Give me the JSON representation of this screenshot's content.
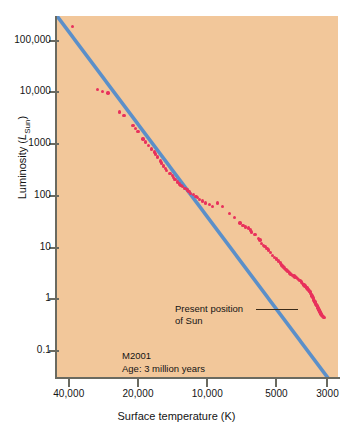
{
  "chart_data": {
    "type": "scatter",
    "title": "",
    "xlabel": "Surface temperature (K)",
    "ylabel": "Luminosity (L_Sun)",
    "ylabel_parts": {
      "text": "Luminosity (",
      "italic": "L",
      "sub": "Sun",
      "close": ")"
    },
    "x_scale": "log-reversed",
    "y_scale": "log",
    "xlim": [
      45000,
      2700
    ],
    "ylim": [
      0.03,
      300000
    ],
    "xticks": [
      40000,
      20000,
      10000,
      5000,
      3000
    ],
    "xtick_labels": [
      "40,000",
      "20,000",
      "10,000",
      "5000",
      "3000"
    ],
    "yticks": [
      100000,
      10000,
      1000,
      100,
      10,
      1,
      0.1
    ],
    "ytick_labels": [
      "100,000",
      "10,000",
      "1000",
      "100",
      "10",
      "1",
      "0.1"
    ],
    "grid": false,
    "legend": "none",
    "background_color": "#f2c79a",
    "point_color": "#e8315c",
    "line_color": "#5b8fc9",
    "annotations": [
      {
        "name": "present-position-of-sun",
        "line1": "Present position",
        "line2": "of Sun"
      },
      {
        "name": "cluster-id",
        "line1": "M2001",
        "line2": "Age: 3 million years"
      }
    ],
    "series": [
      {
        "name": "main-sequence-fit",
        "type": "line",
        "color": "#5b8fc9",
        "points": [
          [
            45000,
            300000
          ],
          [
            2950,
            0.028
          ]
        ]
      },
      {
        "name": "cluster-stars",
        "type": "scatter",
        "color": "#e8315c",
        "points": [
          [
            38500,
            190000
          ],
          [
            30000,
            11500
          ],
          [
            28500,
            10500
          ],
          [
            27000,
            9800
          ],
          [
            24000,
            4200
          ],
          [
            23000,
            3600
          ],
          [
            21000,
            2300
          ],
          [
            20500,
            2000
          ],
          [
            20000,
            1750
          ],
          [
            19000,
            1250
          ],
          [
            18500,
            1100
          ],
          [
            18000,
            950
          ],
          [
            17500,
            800
          ],
          [
            17000,
            700
          ],
          [
            16800,
            640
          ],
          [
            16500,
            560
          ],
          [
            16000,
            470
          ],
          [
            15800,
            430
          ],
          [
            15500,
            380
          ],
          [
            15200,
            340
          ],
          [
            15000,
            310
          ],
          [
            14500,
            270
          ],
          [
            14200,
            245
          ],
          [
            14000,
            225
          ],
          [
            13800,
            205
          ],
          [
            13500,
            185
          ],
          [
            13200,
            170
          ],
          [
            13000,
            160
          ],
          [
            12800,
            150
          ],
          [
            12500,
            140
          ],
          [
            12200,
            130
          ],
          [
            12000,
            120
          ],
          [
            11800,
            112
          ],
          [
            11500,
            105
          ],
          [
            11200,
            98
          ],
          [
            11000,
            92
          ],
          [
            10800,
            86
          ],
          [
            10500,
            80
          ],
          [
            10200,
            72
          ],
          [
            9800,
            68
          ],
          [
            9500,
            62
          ],
          [
            9000,
            72
          ],
          [
            8600,
            62
          ],
          [
            8000,
            45
          ],
          [
            7600,
            38
          ],
          [
            7200,
            30
          ],
          [
            7000,
            27
          ],
          [
            6800,
            25
          ],
          [
            6600,
            24
          ],
          [
            6500,
            22
          ],
          [
            6400,
            20
          ],
          [
            6200,
            18
          ],
          [
            6000,
            15
          ],
          [
            5900,
            14
          ],
          [
            5800,
            12
          ],
          [
            5700,
            11
          ],
          [
            5600,
            10.5
          ],
          [
            5500,
            9.5
          ],
          [
            5400,
            9
          ],
          [
            5300,
            8
          ],
          [
            5200,
            7
          ],
          [
            5100,
            6.5
          ],
          [
            5000,
            6
          ],
          [
            4900,
            5.5
          ],
          [
            4800,
            5
          ],
          [
            4750,
            4.6
          ],
          [
            4700,
            4.4
          ],
          [
            4650,
            4.2
          ],
          [
            4600,
            4
          ],
          [
            4550,
            3.8
          ],
          [
            4500,
            3.6
          ],
          [
            4450,
            3.4
          ],
          [
            4400,
            3.2
          ],
          [
            4350,
            3.1
          ],
          [
            4300,
            3
          ],
          [
            4250,
            2.9
          ],
          [
            4200,
            2.8
          ],
          [
            4150,
            2.7
          ],
          [
            4100,
            2.6
          ],
          [
            4050,
            2.5
          ],
          [
            4000,
            2.4
          ],
          [
            3950,
            2.3
          ],
          [
            3900,
            2.2
          ],
          [
            3880,
            2.1
          ],
          [
            3850,
            2.0
          ],
          [
            3820,
            1.95
          ],
          [
            3800,
            1.9
          ],
          [
            3780,
            1.85
          ],
          [
            3750,
            1.8
          ],
          [
            3730,
            1.75
          ],
          [
            3700,
            1.7
          ],
          [
            3680,
            1.65
          ],
          [
            3660,
            1.6
          ],
          [
            3640,
            1.55
          ],
          [
            3620,
            1.5
          ],
          [
            3600,
            1.45
          ],
          [
            3580,
            1.4
          ],
          [
            3560,
            1.35
          ],
          [
            3550,
            1.3
          ],
          [
            3530,
            1.25
          ],
          [
            3510,
            1.2
          ],
          [
            3500,
            1.15
          ],
          [
            3480,
            1.1
          ],
          [
            3460,
            1.05
          ],
          [
            3450,
            1.0
          ],
          [
            3430,
            0.95
          ],
          [
            3410,
            0.9
          ],
          [
            3400,
            0.88
          ],
          [
            3380,
            0.85
          ],
          [
            3360,
            0.8
          ],
          [
            3350,
            0.78
          ],
          [
            3330,
            0.75
          ],
          [
            3320,
            0.72
          ],
          [
            3300,
            0.68
          ],
          [
            3280,
            0.65
          ],
          [
            3270,
            0.62
          ],
          [
            3250,
            0.6
          ],
          [
            3230,
            0.57
          ],
          [
            3220,
            0.55
          ],
          [
            3200,
            0.52
          ],
          [
            3180,
            0.5
          ],
          [
            3160,
            0.48
          ],
          [
            3150,
            0.46
          ],
          [
            3120,
            0.45
          ],
          [
            3100,
            0.44
          ]
        ]
      }
    ]
  }
}
